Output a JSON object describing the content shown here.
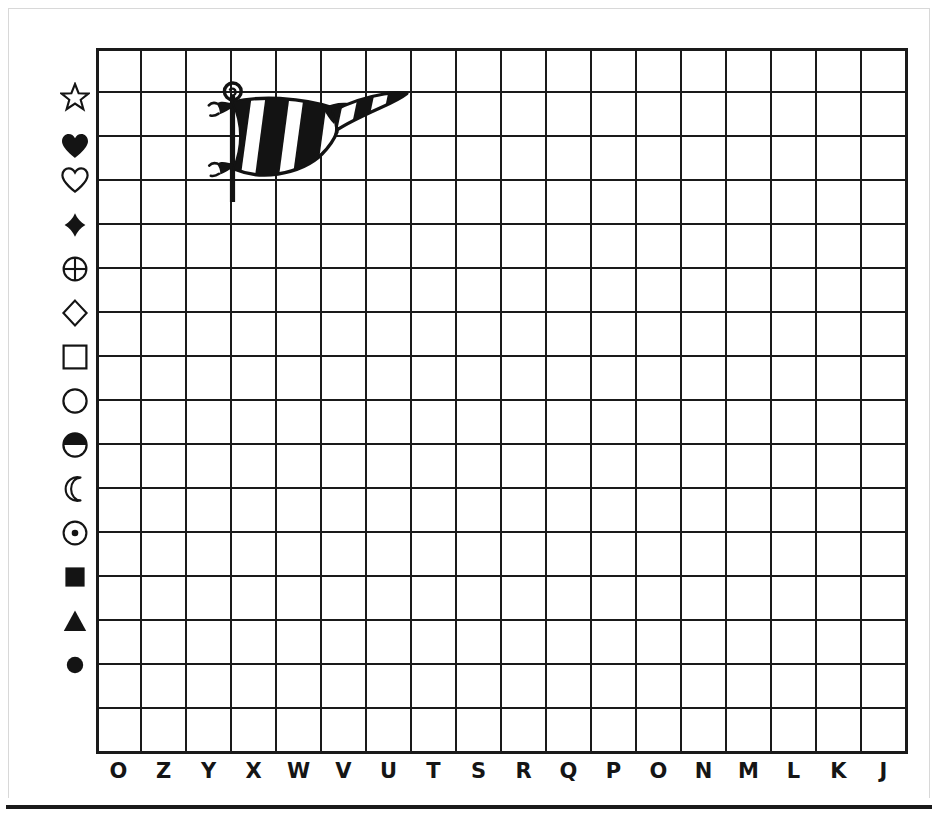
{
  "worksheet": {
    "title": "Pennant Flag Coordinate Grid",
    "description": "Blank coordinate grid worksheet with a striped pennant flag drawing in the upper-left area.",
    "background_color": "#ffffff",
    "ink_color": "#1a1a1a"
  },
  "grid": {
    "columns": 18,
    "rows": 16,
    "cell_width": 45,
    "cell_height": 44,
    "left": 96,
    "top": 48,
    "line_color": "#1a1a1a",
    "line_width": 1.6,
    "border_width": 3,
    "fill_color": "#ffffff"
  },
  "row_symbols": [
    {
      "name": "star-outline-symbol",
      "label": "star",
      "filled": false
    },
    {
      "name": "heart-filled-symbol",
      "label": "heart",
      "filled": true
    },
    {
      "name": "heart-outline-symbol",
      "label": "heart outline",
      "filled": false
    },
    {
      "name": "diamond-filled-symbol",
      "label": "diamond",
      "filled": true
    },
    {
      "name": "circle-cross-symbol",
      "label": "circle with cross",
      "filled": false
    },
    {
      "name": "diamond-outline-symbol",
      "label": "diamond outline",
      "filled": false
    },
    {
      "name": "square-outline-symbol",
      "label": "square outline",
      "filled": false
    },
    {
      "name": "circle-outline-symbol",
      "label": "circle outline",
      "filled": false
    },
    {
      "name": "half-circle-symbol",
      "label": "half filled circle",
      "filled": true
    },
    {
      "name": "crescent-moon-symbol",
      "label": "crescent moon",
      "filled": false
    },
    {
      "name": "circle-dot-symbol",
      "label": "circle with dot",
      "filled": false
    },
    {
      "name": "square-filled-symbol",
      "label": "filled square",
      "filled": true
    },
    {
      "name": "triangle-filled-symbol",
      "label": "filled triangle",
      "filled": true
    },
    {
      "name": "circle-filled-symbol",
      "label": "filled circle",
      "filled": true
    }
  ],
  "column_labels": [
    "O",
    "Z",
    "Y",
    "X",
    "W",
    "V",
    "U",
    "T",
    "S",
    "R",
    "Q",
    "P",
    "O",
    "N",
    "M",
    "L",
    "K",
    "J"
  ],
  "artwork": {
    "name": "pennant-flag-drawing",
    "label": "Striped pennant flag on a pole",
    "style": "black and white line art with diagonal stripes",
    "parts": [
      "finial-ring",
      "flag-pole",
      "upper-tie-knot",
      "lower-tie-knot",
      "striped-banner",
      "banner-tail"
    ],
    "stripe_count": 5
  }
}
